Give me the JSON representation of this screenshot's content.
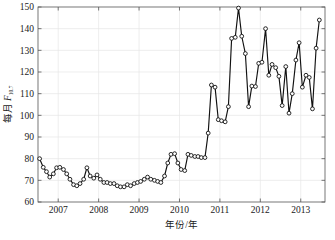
{
  "chart_data": {
    "type": "line",
    "title": "",
    "xlabel": "年份/年",
    "ylabel": "每月 F10.7",
    "ylabel_main": "每月 ",
    "ylabel_symbol": "F",
    "ylabel_subscript": "10.7",
    "xlim": [
      2006.5,
      2013.6
    ],
    "ylim": [
      60,
      150
    ],
    "grid": true,
    "legend": "none",
    "marker": "circle-open",
    "line_color": "#111111",
    "marker_face_color": "#ffffff",
    "grid_color": "#e6e6e6",
    "xticks": [
      2007,
      2008,
      2009,
      2010,
      2011,
      2012,
      2013
    ],
    "xtick_labels": [
      "2007",
      "2008",
      "2009",
      "2010",
      "2011",
      "2012",
      "2013"
    ],
    "yticks": [
      60,
      70,
      80,
      90,
      100,
      110,
      120,
      130,
      140,
      150
    ],
    "ytick_labels": [
      "60",
      "70",
      "80",
      "90",
      "100",
      "110",
      "120",
      "130",
      "140",
      "150"
    ],
    "series": [
      {
        "name": "每月 F10.7",
        "x": [
          2006.54,
          2006.63,
          2006.71,
          2006.79,
          2006.88,
          2006.96,
          2007.04,
          2007.13,
          2007.21,
          2007.29,
          2007.38,
          2007.46,
          2007.54,
          2007.63,
          2007.71,
          2007.79,
          2007.88,
          2007.96,
          2008.04,
          2008.13,
          2008.21,
          2008.29,
          2008.38,
          2008.46,
          2008.54,
          2008.63,
          2008.71,
          2008.79,
          2008.88,
          2008.96,
          2009.04,
          2009.13,
          2009.21,
          2009.29,
          2009.38,
          2009.46,
          2009.54,
          2009.63,
          2009.71,
          2009.79,
          2009.88,
          2009.96,
          2010.04,
          2010.13,
          2010.21,
          2010.29,
          2010.38,
          2010.46,
          2010.54,
          2010.63,
          2010.71,
          2010.79,
          2010.88,
          2010.96,
          2011.04,
          2011.13,
          2011.21,
          2011.29,
          2011.38,
          2011.46,
          2011.54,
          2011.63,
          2011.71,
          2011.79,
          2011.88,
          2011.96,
          2012.04,
          2012.13,
          2012.21,
          2012.29,
          2012.38,
          2012.46,
          2012.54,
          2012.63,
          2012.71,
          2012.79,
          2012.88,
          2012.96,
          2013.04,
          2013.13,
          2013.21,
          2013.29,
          2013.38,
          2013.46
        ],
        "values": [
          80.0,
          76.0,
          74.0,
          71.5,
          73.0,
          75.8,
          76.0,
          75.0,
          73.0,
          70.5,
          68.0,
          67.5,
          68.5,
          70.5,
          75.8,
          72.0,
          71.0,
          72.5,
          70.5,
          69.0,
          69.0,
          68.5,
          68.5,
          67.5,
          67.0,
          67.0,
          68.0,
          67.5,
          68.5,
          69.0,
          69.5,
          70.5,
          71.5,
          70.5,
          70.0,
          69.5,
          69.0,
          72.0,
          78.0,
          82.0,
          82.3,
          78.0,
          75.0,
          74.5,
          82.0,
          81.5,
          81.0,
          81.0,
          80.5,
          80.5,
          91.8,
          114.0,
          113.0,
          98.0,
          97.5,
          97.0,
          104.0,
          135.5,
          136.0,
          149.5,
          136.5,
          128.5,
          104.0,
          113.5,
          113.3,
          124.0,
          124.5,
          140.0,
          118.5,
          123.5,
          122.0,
          118.0,
          104.5,
          122.5,
          101.0,
          110.0,
          125.5,
          133.5,
          113.0,
          118.5,
          117.5,
          103.0,
          131.0,
          144.0
        ]
      }
    ]
  },
  "figure": {
    "background_color": "#ffffff",
    "plot_left_px": 38,
    "plot_right_px": 325,
    "plot_top_px": 7,
    "plot_bottom_px": 202
  }
}
